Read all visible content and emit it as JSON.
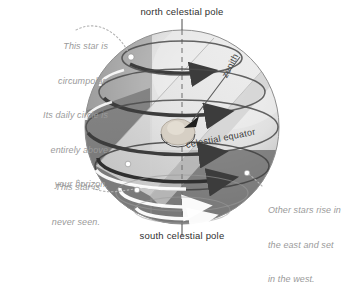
{
  "diagram": {
    "labels": {
      "north_pole": "north celestial pole",
      "south_pole": "south celestial pole",
      "celestial_equator": "celestial equator",
      "zenith": "zenith"
    },
    "annotations": [
      {
        "id": "circumpolar",
        "align": "right",
        "lines": [
          "This star is",
          "circumpolar.",
          "Its daily circle is",
          "entirely above",
          "your horizon."
        ]
      },
      {
        "id": "never-seen",
        "align": "right",
        "lines": [
          "This star is",
          "never seen."
        ]
      },
      {
        "id": "rise-and-set",
        "align": "left",
        "lines": [
          "Other stars rise in",
          "the east and set",
          "in the west."
        ]
      }
    ],
    "colors": {
      "background": "#ffffff",
      "sphere_light": "#e8e8e8",
      "sphere_midlight": "#d2d2d2",
      "sphere_mid": "#a8a8a8",
      "sphere_dark": "#6e6e6e",
      "sphere_darkest": "#5a5a5a",
      "horizon_band": "#dcdcdc",
      "ring_dark": "#3c3c3c",
      "ring_light": "#ffffff",
      "label_dark": "#2f2f2f",
      "label_gray": "#9a9a9a",
      "leader_dotted": "#b5b5b5",
      "star_marker": "#ffffff"
    },
    "geometry": {
      "sphere_center_x": 182,
      "sphere_center_y": 127,
      "sphere_radius": 97,
      "ring_count": 6,
      "axis_tilt_note": "vertical polar axis, horizon plane tilted"
    }
  }
}
